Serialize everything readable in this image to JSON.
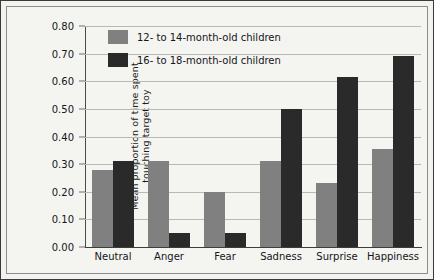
{
  "chart_data": {
    "type": "bar",
    "title": "",
    "xlabel": "",
    "ylabel_line1": "Mean proportion of time spent",
    "ylabel_line2": "touching target toy",
    "categories": [
      "Neutral",
      "Anger",
      "Fear",
      "Sadness",
      "Surprise",
      "Happiness"
    ],
    "series": [
      {
        "name": "12- to 14-month-old children",
        "color": "#808080",
        "values": [
          0.28,
          0.31,
          0.2,
          0.31,
          0.23,
          0.355
        ]
      },
      {
        "name": "16- to 18-month-old children",
        "color": "#2a2a2a",
        "values": [
          0.31,
          0.05,
          0.05,
          0.5,
          0.615,
          0.69
        ]
      }
    ],
    "ylim": [
      0.0,
      0.8
    ],
    "ytick_step": 0.1,
    "ytick_labels": [
      "0.80",
      "0.70",
      "0.60",
      "0.50",
      "0.40",
      "0.30",
      "0.20",
      "0.10",
      "0.00"
    ],
    "ytick_values": [
      0.8,
      0.7,
      0.6,
      0.5,
      0.4,
      0.3,
      0.2,
      0.1,
      0.0
    ],
    "grid": true,
    "legend_position": "top-left-inside"
  }
}
